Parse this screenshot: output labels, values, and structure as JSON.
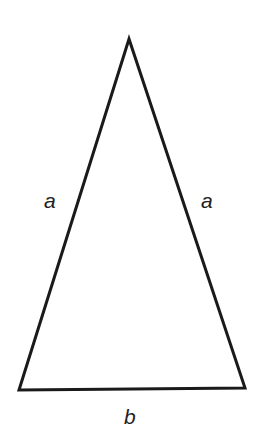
{
  "diagram": {
    "type": "isosceles-triangle",
    "colors": {
      "stroke": "#1a1a1a",
      "label": "#222222",
      "background": "#ffffff"
    },
    "vertices": {
      "apex": [
        129,
        39
      ],
      "bottom_left": [
        19,
        390
      ],
      "bottom_right": [
        245,
        388
      ]
    },
    "labels": {
      "left_side": "a",
      "right_side": "a",
      "base": "b"
    }
  }
}
